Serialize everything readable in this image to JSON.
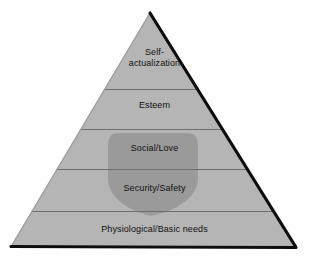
{
  "diagram": {
    "type": "pyramid",
    "background_color": "#fefefe",
    "tier_fill_color": "#b5b5b5",
    "overlay_fill_color": "#9a9a9a",
    "outline_color": "#0d0d0d",
    "divider_color": "#6f6f6f",
    "text_color": "#101010",
    "tiers": [
      {
        "id": "self-actualization",
        "label": "Self-\nactualization",
        "level": 5
      },
      {
        "id": "esteem",
        "label": "Esteem",
        "level": 4
      },
      {
        "id": "social-love",
        "label": "Social/Love",
        "level": 3
      },
      {
        "id": "security-safety",
        "label": "Security/Safety",
        "level": 2
      },
      {
        "id": "physiological-basic-needs",
        "label": "Physiological/Basic needs",
        "level": 1
      }
    ],
    "overlay_shape": {
      "id": "shield-highlight",
      "name": "shield-overlay",
      "spans_tiers": [
        "social-love",
        "security-safety"
      ]
    }
  }
}
